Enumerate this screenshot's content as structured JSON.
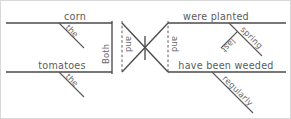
{
  "diagram": {
    "type": "reed-kellogg-sentence-diagram",
    "sentence": "Both the corn and the tomatoes were planted last spring and have been weeded regularly.",
    "line_color": "#4a4a4a",
    "text_color": "#5b5b5b",
    "background": "#ffffff",
    "subjects": {
      "upper": {
        "noun": "corn",
        "modifier": "the"
      },
      "lower": {
        "noun": "tomatoes",
        "modifier": "the"
      }
    },
    "predicates": {
      "upper": {
        "verb": "were planted",
        "modifier": "spring",
        "submodifier": "last"
      },
      "lower": {
        "verb": "have been weeded",
        "modifier": "regularly"
      }
    },
    "conjunctions": {
      "subject_correlative_first": "Both",
      "subject_correlative_second": "and",
      "predicate_conjunction": "and"
    },
    "labels": {
      "corn": "corn",
      "the_upper": "the",
      "tomatoes": "tomatoes",
      "the_lower": "the",
      "both": "Both",
      "and_left": "and",
      "and_right": "and",
      "were_planted": "were planted",
      "spring": "spring",
      "last": "last",
      "have_been_weeded": "have been weeded",
      "regularly": "regularly"
    }
  }
}
